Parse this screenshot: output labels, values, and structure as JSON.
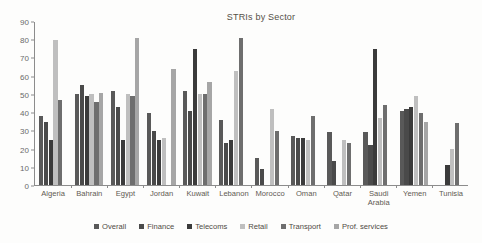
{
  "chart_data": {
    "type": "bar",
    "title": "STRIs by Sector",
    "xlabel": "",
    "ylabel": "",
    "ylim": [
      0,
      90
    ],
    "yticks": [
      0,
      10,
      20,
      30,
      40,
      50,
      60,
      70,
      80,
      90
    ],
    "grid": false,
    "legend_position": "bottom",
    "categories": [
      "Algeria",
      "Bahrain",
      "Egypt",
      "Jordan",
      "Kuwait",
      "Lebanon",
      "Morocco",
      "Oman",
      "Qatar",
      "Saudi Arabia",
      "Yemen",
      "Tunisia"
    ],
    "series": [
      {
        "name": "Overall",
        "color": "#595959",
        "values": [
          38,
          50,
          52,
          40,
          52,
          36,
          15,
          27,
          29,
          29,
          41,
          0
        ]
      },
      {
        "name": "Finance",
        "color": "#4a4a4a",
        "values": [
          35,
          55,
          43,
          30,
          41,
          23,
          9,
          26,
          13,
          22,
          42,
          0
        ]
      },
      {
        "name": "Telecoms",
        "color": "#3b3b3b",
        "values": [
          25,
          49,
          25,
          25,
          75,
          25,
          0,
          26,
          0,
          75,
          43,
          11
        ]
      },
      {
        "name": "Retail",
        "color": "#bfbfbf",
        "values": [
          80,
          50,
          50,
          26,
          50,
          63,
          42,
          25,
          25,
          37,
          49,
          20
        ]
      },
      {
        "name": "Transport",
        "color": "#6e6e6e",
        "values": [
          47,
          46,
          49,
          0,
          50,
          81,
          30,
          38,
          23,
          44,
          40,
          34
        ]
      },
      {
        "name": "Prof. services",
        "color": "#a6a6a6",
        "values": [
          0,
          51,
          81,
          64,
          57,
          0,
          0,
          0,
          0,
          0,
          35,
          0
        ]
      }
    ]
  }
}
